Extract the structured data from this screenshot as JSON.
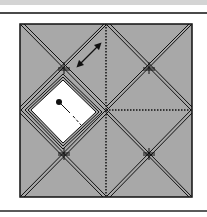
{
  "diagram": {
    "type": "origami-crease-pattern",
    "caption": "",
    "colors": {
      "paper_fill": "#a8a8a8",
      "flap_fill": "#ffffff",
      "line": "#111111",
      "band": "#d4d4d4",
      "rule": "#4a4a4a"
    },
    "square": {
      "x": 20,
      "y": 24,
      "w": 172,
      "h": 173
    },
    "center": {
      "x": 106,
      "y": 110
    },
    "intersections": [
      {
        "name": "top-left",
        "x": 64,
        "y": 68
      },
      {
        "name": "top-right",
        "x": 149,
        "y": 68
      },
      {
        "name": "bottom-left",
        "x": 64,
        "y": 154
      },
      {
        "name": "bottom-right",
        "x": 149,
        "y": 154
      }
    ],
    "valley_lines": [
      {
        "name": "vertical-center",
        "x1": 106,
        "y1": 24,
        "x2": 106,
        "y2": 197
      },
      {
        "name": "horizontal-right",
        "x1": 106,
        "y1": 110,
        "x2": 192,
        "y2": 110
      }
    ],
    "white_flap": {
      "top": [
        63,
        78
      ],
      "right": [
        98,
        112
      ],
      "bottom": [
        63,
        145
      ],
      "left": [
        29,
        110
      ]
    },
    "arrow": {
      "type": "double-headed",
      "x1": 77,
      "y1": 67,
      "x2": 101,
      "y2": 43
    },
    "pin": {
      "dot": [
        59,
        102
      ],
      "end": [
        81,
        125
      ]
    }
  }
}
